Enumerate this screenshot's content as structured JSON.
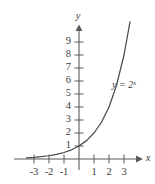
{
  "figure": {
    "name": "exponential-function-graph",
    "background_color": "#ffffff",
    "ink_color": "#4a4a4a",
    "axis_color": "#58595b"
  },
  "axes": {
    "x_axis_label": "x",
    "y_axis_label": "y",
    "x_ticks": [
      "-3",
      "-2",
      "-1",
      "1",
      "2",
      "3"
    ],
    "x_tick_values": [
      -3,
      -2,
      -1,
      1,
      2,
      3
    ],
    "y_ticks": [
      "1",
      "2",
      "3",
      "4",
      "5",
      "6",
      "7",
      "8",
      "9"
    ],
    "y_tick_values": [
      1,
      2,
      3,
      4,
      5,
      6,
      7,
      8,
      9
    ]
  },
  "curve": {
    "label_base": "y = 2",
    "label_exponent": "x",
    "label_full": "y = 2^x"
  },
  "chart_data": {
    "type": "line",
    "title": "",
    "subtitle": "",
    "xlabel": "x",
    "ylabel": "y",
    "xlim": [
      -3.9,
      3.6
    ],
    "ylim": [
      -0.6,
      10.2
    ],
    "grid": false,
    "legend": "none",
    "annotations": [
      {
        "text": "y = 2^x",
        "x": 2.3,
        "y": 5.6
      }
    ],
    "xticks": [
      -3,
      -2,
      -1,
      1,
      2,
      3
    ],
    "yticks": [
      1,
      2,
      3,
      4,
      5,
      6,
      7,
      8,
      9
    ],
    "series": [
      {
        "name": "y = 2^x",
        "formula": "y = 2^x",
        "x": [
          -3.5,
          -3,
          -2.5,
          -2,
          -1.5,
          -1,
          -0.5,
          0,
          0.5,
          1,
          1.5,
          2,
          2.5,
          3,
          3.4
        ],
        "values": [
          0.088,
          0.125,
          0.177,
          0.25,
          0.354,
          0.5,
          0.707,
          1,
          1.414,
          2,
          2.828,
          4,
          5.657,
          8,
          10.556
        ]
      }
    ]
  }
}
